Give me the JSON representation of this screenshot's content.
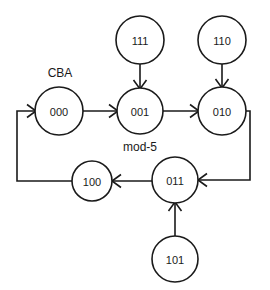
{
  "diagram": {
    "type": "state-transition-diagram",
    "colors": {
      "background": "#ffffff",
      "stroke": "#1a1a1a",
      "node_fill": "#ffffff"
    },
    "annotations": [
      {
        "id": "cba",
        "text": "CBA",
        "x": 60,
        "y": 73
      },
      {
        "id": "mod5",
        "text": "mod-5",
        "x": 140,
        "y": 147
      }
    ],
    "nodes": [
      {
        "id": "n111",
        "label": "111",
        "cx": 140,
        "cy": 40,
        "r": 24
      },
      {
        "id": "n110",
        "label": "110",
        "cx": 222,
        "cy": 40,
        "r": 24
      },
      {
        "id": "n000",
        "label": "000",
        "cx": 59,
        "cy": 111,
        "r": 24
      },
      {
        "id": "n001",
        "label": "001",
        "cx": 140,
        "cy": 111,
        "r": 23
      },
      {
        "id": "n010",
        "label": "010",
        "cx": 222,
        "cy": 111,
        "r": 24
      },
      {
        "id": "n100",
        "label": "100",
        "cx": 92,
        "cy": 181,
        "r": 20
      },
      {
        "id": "n011",
        "label": "011",
        "cx": 175,
        "cy": 180,
        "r": 23
      },
      {
        "id": "n101",
        "label": "101",
        "cx": 175,
        "cy": 259,
        "r": 23
      }
    ],
    "edges": [
      {
        "id": "e-000-001",
        "from": "000",
        "to": "001",
        "kind": "straight-right"
      },
      {
        "id": "e-001-010",
        "from": "001",
        "to": "010",
        "kind": "straight-right"
      },
      {
        "id": "e-111-001",
        "from": "111",
        "to": "001",
        "kind": "straight-down"
      },
      {
        "id": "e-110-010",
        "from": "110",
        "to": "010",
        "kind": "straight-down"
      },
      {
        "id": "e-010-011",
        "from": "010",
        "to": "011",
        "kind": "routed-right-down-left"
      },
      {
        "id": "e-011-100",
        "from": "011",
        "to": "100",
        "kind": "straight-left"
      },
      {
        "id": "e-101-011",
        "from": "101",
        "to": "011",
        "kind": "straight-up"
      },
      {
        "id": "e-100-000",
        "from": "100",
        "to": "000",
        "kind": "routed-left-up-right"
      }
    ]
  }
}
